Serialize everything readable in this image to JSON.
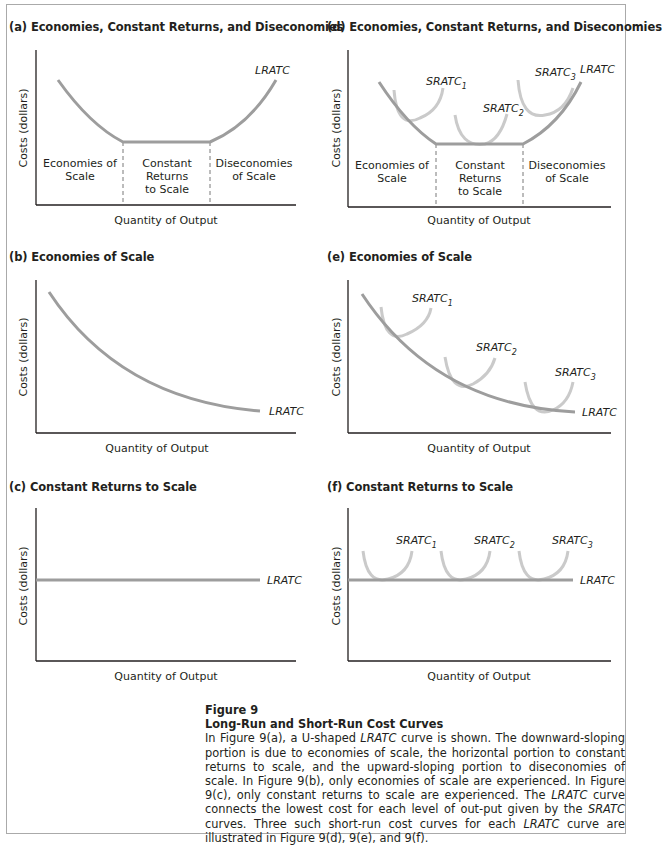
{
  "figure": {
    "number": "Figure 9",
    "title": "Long-Run and Short-Run Cost Curves",
    "caption_parts": [
      {
        "t": "In Figure 9(a), a U-shaped ",
        "i": false
      },
      {
        "t": "LRATC",
        "i": true
      },
      {
        "t": " curve is shown. The downward-sloping portion is due to economies of scale, the horizontal portion to constant returns to scale, and the upward-sloping portion to diseconomies of scale. In Figure 9(b), only economies of scale are experienced. In Figure 9(c), only constant returns to scale are experienced. The ",
        "i": false
      },
      {
        "t": "LRATC",
        "i": true
      },
      {
        "t": " curve connects the lowest cost for each level of out-put given by the ",
        "i": false
      },
      {
        "t": "SRATC",
        "i": true
      },
      {
        "t": " curves. Three such short-run cost curves for each ",
        "i": false
      },
      {
        "t": "LRATC",
        "i": true
      },
      {
        "t": " curve are illustrated in Figure 9(d), 9(e), and 9(f).",
        "i": false
      }
    ]
  },
  "colors": {
    "lratc": "#9d9d9d",
    "sratc": "#cacaca",
    "axis": "#231f20",
    "frame": "#aaaaaa"
  },
  "panels": {
    "a": {
      "title": "(a) Economies, Constant Returns, and Diseconomies",
      "ylabel": "Costs (dollars)",
      "xlabel": "Quantity of Output",
      "curve_label": "LRATC",
      "regions": [
        [
          "Economies of",
          "Scale"
        ],
        [
          "Constant",
          "Returns",
          "to Scale"
        ],
        [
          "Diseconomies",
          "of Scale"
        ]
      ]
    },
    "b": {
      "title": "(b) Economies of Scale",
      "ylabel": "Costs (dollars)",
      "xlabel": "Quantity of Output",
      "curve_label": "LRATC"
    },
    "c": {
      "title": "(c) Constant Returns to Scale",
      "ylabel": "Costs (dollars)",
      "xlabel": "Quantity of Output",
      "curve_label": "LRATC"
    },
    "d": {
      "title": "(d) Economies, Constant Returns, and Diseconomies",
      "ylabel": "Costs (dollars)",
      "xlabel": "Quantity of Output",
      "curve_label": "LRATC",
      "sratc": [
        "SRATC",
        "1",
        "SRATC",
        "2",
        "SRATC",
        "3"
      ],
      "regions": [
        [
          "Economies of",
          "Scale"
        ],
        [
          "Constant",
          "Returns",
          "to Scale"
        ],
        [
          "Diseconomies",
          "of Scale"
        ]
      ]
    },
    "e": {
      "title": "(e) Economies of Scale",
      "ylabel": "Costs (dollars)",
      "xlabel": "Quantity of Output",
      "curve_label": "LRATC"
    },
    "f": {
      "title": "(f) Constant Returns to Scale",
      "ylabel": "Costs (dollars)",
      "xlabel": "Quantity of Output",
      "curve_label": "LRATC"
    }
  },
  "sub": {
    "one": "1",
    "two": "2",
    "three": "3",
    "sr": "SRATC"
  },
  "chart_data": [
    {
      "type": "line",
      "title": "(a) Economies, Constant Returns, and Diseconomies",
      "xlabel": "Quantity of Output",
      "ylabel": "Costs (dollars)",
      "series": [
        {
          "name": "LRATC",
          "shape": "U-shaped: decreasing, flat, increasing"
        }
      ],
      "annotations": [
        "Economies of Scale",
        "Constant Returns to Scale",
        "Diseconomies of Scale"
      ],
      "grid": false
    },
    {
      "type": "line",
      "title": "(b) Economies of Scale",
      "xlabel": "Quantity of Output",
      "ylabel": "Costs (dollars)",
      "series": [
        {
          "name": "LRATC",
          "shape": "decreasing, convex"
        }
      ],
      "grid": false
    },
    {
      "type": "line",
      "title": "(c) Constant Returns to Scale",
      "xlabel": "Quantity of Output",
      "ylabel": "Costs (dollars)",
      "series": [
        {
          "name": "LRATC",
          "shape": "horizontal"
        }
      ],
      "grid": false
    },
    {
      "type": "line",
      "title": "(d) Economies, Constant Returns, and Diseconomies",
      "xlabel": "Quantity of Output",
      "ylabel": "Costs (dollars)",
      "series": [
        {
          "name": "LRATC",
          "shape": "U-shaped"
        },
        {
          "name": "SRATC1"
        },
        {
          "name": "SRATC2"
        },
        {
          "name": "SRATC3"
        }
      ],
      "annotations": [
        "Economies of Scale",
        "Constant Returns to Scale",
        "Diseconomies of Scale"
      ],
      "grid": false
    },
    {
      "type": "line",
      "title": "(e) Economies of Scale",
      "xlabel": "Quantity of Output",
      "ylabel": "Costs (dollars)",
      "series": [
        {
          "name": "LRATC",
          "shape": "decreasing"
        },
        {
          "name": "SRATC1"
        },
        {
          "name": "SRATC2"
        },
        {
          "name": "SRATC3"
        }
      ],
      "grid": false
    },
    {
      "type": "line",
      "title": "(f) Constant Returns to Scale",
      "xlabel": "Quantity of Output",
      "ylabel": "Costs (dollars)",
      "series": [
        {
          "name": "LRATC",
          "shape": "horizontal"
        },
        {
          "name": "SRATC1"
        },
        {
          "name": "SRATC2"
        },
        {
          "name": "SRATC3"
        }
      ],
      "grid": false
    }
  ]
}
